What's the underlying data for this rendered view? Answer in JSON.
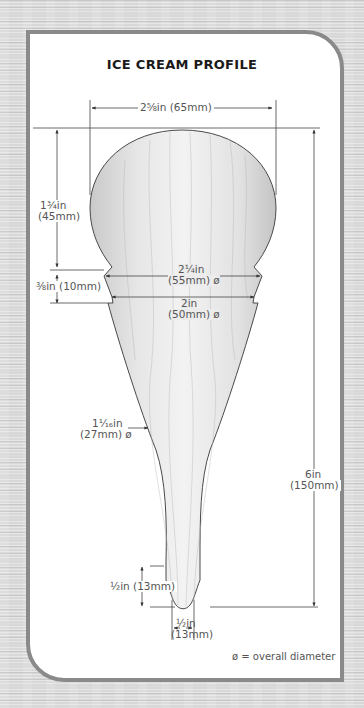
{
  "title": "ICE CREAM PROFILE",
  "dimensions": {
    "top_width": "2⅝in (65mm)",
    "ball_height_line1": "1¾in",
    "ball_height_line2": "(45mm)",
    "collar_height": "⅜in (10mm)",
    "collar_top_dia_line1": "2¼in",
    "collar_top_dia_line2": "(55mm) ø",
    "collar_bottom_dia_line1": "2in",
    "collar_bottom_dia_line2": "(50mm) ø",
    "neck_dia_line1": "1¹⁄₁₆in",
    "neck_dia_line2": "(27mm) ø",
    "overall_height_line1": "6in",
    "overall_height_line2": "(150mm)",
    "tip_height": "½in (13mm)",
    "tip_dia_line1": "½in",
    "tip_dia_line2": "(13mm)"
  },
  "legend": "ø = overall diameter",
  "colors": {
    "panel_border": "#8a8a8a",
    "panel_bg": "#ffffff",
    "wood_light": "#f2f2f2",
    "wood_shade": "#c4c4c4",
    "line": "#444444",
    "label": "#555555"
  }
}
